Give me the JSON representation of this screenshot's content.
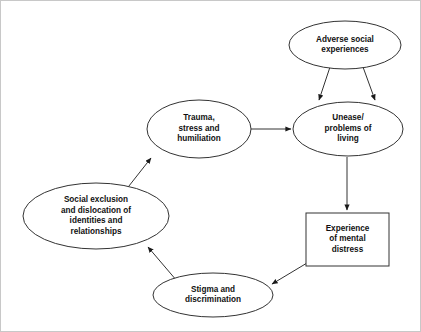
{
  "diagram": {
    "background_color": "#ffffff",
    "stroke_color": "#333333",
    "text_color": "#111111",
    "nodes": [
      {
        "id": "adverse-social-experiences",
        "label": "Adverse social\nexperiences",
        "shape": "ellipse",
        "cx": 344,
        "cy": 44,
        "rx": 56,
        "ry": 24
      },
      {
        "id": "unease-problems-of-living",
        "label": "Unease/\nproblems of\nliving",
        "shape": "ellipse",
        "cx": 347,
        "cy": 128,
        "rx": 55,
        "ry": 27
      },
      {
        "id": "trauma-stress-humiliation",
        "label": "Trauma,\nstress and\nhumiliation",
        "shape": "ellipse",
        "cx": 198,
        "cy": 128,
        "rx": 52,
        "ry": 29
      },
      {
        "id": "social-exclusion-dislocation",
        "label": "Social exclusion\nand dislocation of\nidentities and\nrelationships",
        "shape": "ellipse",
        "cx": 95,
        "cy": 215,
        "rx": 73,
        "ry": 33
      },
      {
        "id": "experience-of-mental-distress",
        "label": "Experience\nof mental\ndistress",
        "shape": "rect",
        "x": 305,
        "y": 212,
        "width": 83,
        "height": 53
      },
      {
        "id": "stigma-and-discrimination",
        "label": "Stigma and\ndiscrimination",
        "shape": "ellipse",
        "cx": 212,
        "cy": 294,
        "rx": 60,
        "ry": 22
      }
    ],
    "edges": [
      {
        "id": "adverse-to-unease-left",
        "from": "adverse-social-experiences",
        "to": "unease-problems-of-living",
        "path": "M 329 66 L 318 99",
        "arrow": true
      },
      {
        "id": "adverse-to-unease-right",
        "from": "adverse-social-experiences",
        "to": "unease-problems-of-living",
        "path": "M 362 66 L 374 99",
        "arrow": true
      },
      {
        "id": "trauma-to-unease",
        "from": "trauma-stress-humiliation",
        "to": "unease-problems-of-living",
        "path": "M 250 128 L 290 128",
        "arrow": true
      },
      {
        "id": "unease-to-distress",
        "from": "unease-problems-of-living",
        "to": "experience-of-mental-distress",
        "path": "M 346 156 L 346 209",
        "arrow": true
      },
      {
        "id": "distress-to-stigma",
        "from": "experience-of-mental-distress",
        "to": "stigma-and-discrimination",
        "path": "M 306 262 L 271 283",
        "arrow": true
      },
      {
        "id": "stigma-to-social-exclusion",
        "from": "stigma-and-discrimination",
        "to": "social-exclusion-dislocation",
        "path": "M 176 280 L 147 246",
        "arrow": true
      },
      {
        "id": "social-exclusion-to-trauma",
        "from": "social-exclusion-dislocation",
        "to": "trauma-stress-humiliation",
        "path": "M 124 190 L 150 157",
        "arrow": true
      }
    ]
  }
}
